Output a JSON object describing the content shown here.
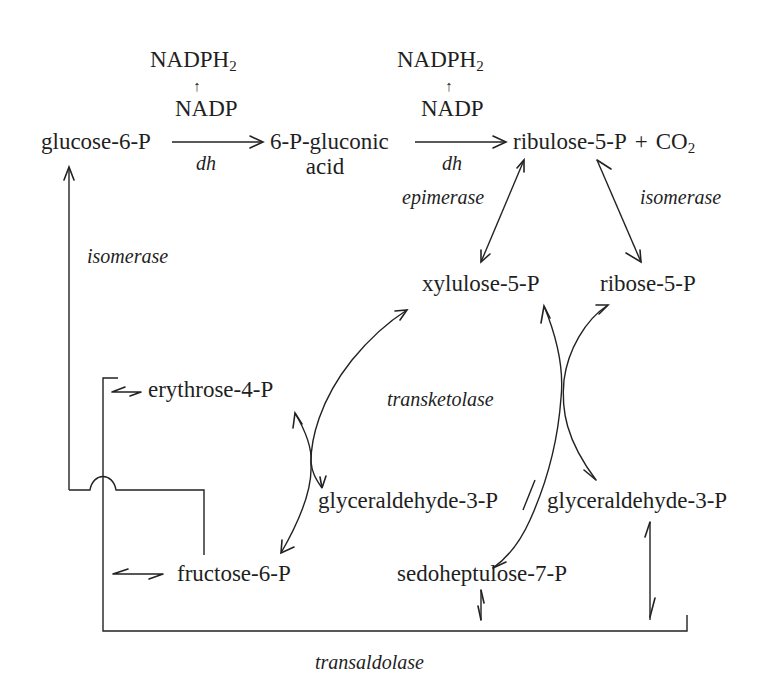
{
  "cofactors": {
    "left": {
      "top": "NADPH",
      "top_sub": "2",
      "arrow": "↑",
      "bottom": "NADP"
    },
    "right": {
      "top": "NADPH",
      "top_sub": "2",
      "arrow": "↑",
      "bottom": "NADP"
    }
  },
  "metabolites": {
    "glucose_6p": "glucose-6-P",
    "gluconic_line1": "6-P-gluconic",
    "gluconic_line2": "acid",
    "ribulose_5p": "ribulose-5-P",
    "plus": "+",
    "co2": "CO",
    "co2_sub": "2",
    "xylulose_5p": "xylulose-5-P",
    "ribose_5p": "ribose-5-P",
    "erythrose_4p": "erythrose-4-P",
    "glyceraldehyde_3p_left": "glyceraldehyde-3-P",
    "glyceraldehyde_3p_right": "glyceraldehyde-3-P",
    "fructose_6p": "fructose-6-P",
    "sedoheptulose_7p": "sedoheptulose-7-P"
  },
  "enzymes": {
    "dh_1": "dh",
    "dh_2": "dh",
    "epimerase": "epimerase",
    "isomerase_right": "isomerase",
    "isomerase_left": "isomerase",
    "transketolase": "transketolase",
    "transaldolase": "transaldolase"
  }
}
